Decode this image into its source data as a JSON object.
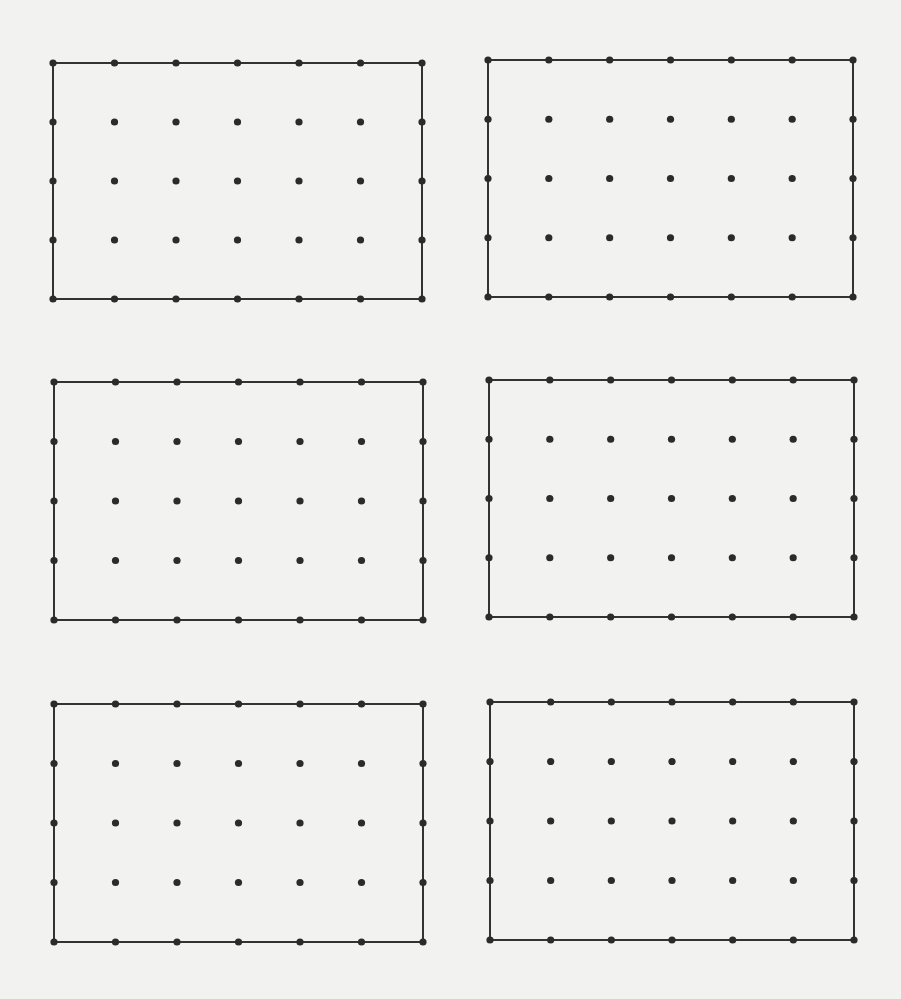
{
  "page": {
    "width": 901,
    "height": 999,
    "background": "#f2f2f1",
    "ink_color": "#2b2b2b",
    "line_color": "#333333"
  },
  "grid_spec": {
    "columns": 7,
    "rows": 5,
    "dot_radius": 3.6,
    "line_width": 2
  },
  "panels": [
    {
      "id": "panel-top-left",
      "x1": 53,
      "y1": 63,
      "x2": 422,
      "y2": 299
    },
    {
      "id": "panel-top-right",
      "x1": 488,
      "y1": 60,
      "x2": 853,
      "y2": 297
    },
    {
      "id": "panel-middle-left",
      "x1": 54,
      "y1": 382,
      "x2": 423,
      "y2": 620
    },
    {
      "id": "panel-middle-right",
      "x1": 489,
      "y1": 380,
      "x2": 854,
      "y2": 617
    },
    {
      "id": "panel-bottom-left",
      "x1": 54,
      "y1": 704,
      "x2": 423,
      "y2": 942
    },
    {
      "id": "panel-bottom-right",
      "x1": 490,
      "y1": 702,
      "x2": 854,
      "y2": 940
    }
  ]
}
